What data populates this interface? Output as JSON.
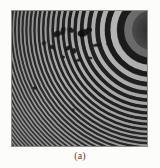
{
  "figure": {
    "caption": "(a)",
    "kind": "interference-fringe-photograph",
    "background_color": "#fcfcfa",
    "plate": {
      "left": 11,
      "top": 10,
      "width": 137,
      "height": 137,
      "border_color": "#8f8f8f"
    },
    "pattern": {
      "type": "concentric-circular-fringes",
      "center_x": 152,
      "center_y": 30,
      "fringe_count": 34,
      "min_gray": "#1d1d1d",
      "max_gray": "#c8c8c8",
      "mean_gray": "#6e6e6e",
      "spacing_px_near_center": 11,
      "spacing_px_far_edge": 3,
      "core_dark_radius": 20
    },
    "defects": [
      {
        "name": "dust-blob-1",
        "cx": 46,
        "cy": 24,
        "rx": 4.0,
        "ry": 3.0,
        "rot": -25,
        "gray": "#141414"
      },
      {
        "name": "dust-blob-2",
        "cx": 52,
        "cy": 21,
        "rx": 2.4,
        "ry": 4.2,
        "rot": 15,
        "gray": "#171717"
      },
      {
        "name": "dust-blob-3",
        "cx": 60,
        "cy": 20,
        "rx": 3.2,
        "ry": 2.2,
        "rot": 40,
        "gray": "#121212"
      },
      {
        "name": "dust-blob-4",
        "cx": 72,
        "cy": 23,
        "rx": 5.5,
        "ry": 3.8,
        "rot": -15,
        "gray": "#101010"
      },
      {
        "name": "dust-blob-5",
        "cx": 78,
        "cy": 20,
        "rx": 3.0,
        "ry": 2.4,
        "rot": 0,
        "gray": "#161616"
      },
      {
        "name": "dust-blob-6",
        "cx": 41,
        "cy": 37,
        "rx": 2.8,
        "ry": 2.0,
        "rot": 20,
        "gray": "#1a1a1a"
      },
      {
        "name": "dust-blob-7",
        "cx": 57,
        "cy": 38,
        "rx": 3.6,
        "ry": 2.0,
        "rot": -30,
        "gray": "#151515"
      },
      {
        "name": "dust-blob-8",
        "cx": 63,
        "cy": 41,
        "rx": 2.2,
        "ry": 3.0,
        "rot": 10,
        "gray": "#181818"
      },
      {
        "name": "dust-blob-9",
        "cx": 86,
        "cy": 35,
        "rx": 4.5,
        "ry": 1.6,
        "rot": -8,
        "gray": "#131313"
      },
      {
        "name": "dust-blob-10",
        "cx": 98,
        "cy": 34,
        "rx": 3.0,
        "ry": 1.4,
        "rot": -5,
        "gray": "#1b1b1b"
      },
      {
        "name": "dust-blob-11",
        "cx": 52,
        "cy": 47,
        "rx": 2.0,
        "ry": 1.6,
        "rot": 0,
        "gray": "#1e1e1e"
      },
      {
        "name": "dust-blob-12",
        "cx": 68,
        "cy": 50,
        "rx": 3.4,
        "ry": 1.5,
        "rot": -12,
        "gray": "#1a1a1a"
      },
      {
        "name": "dust-blob-13",
        "cx": 79,
        "cy": 48,
        "rx": 2.6,
        "ry": 1.3,
        "rot": 8,
        "gray": "#1d1d1d"
      },
      {
        "name": "dust-blob-14",
        "cx": 24,
        "cy": 78,
        "rx": 2.2,
        "ry": 1.8,
        "rot": 0,
        "gray": "#202020"
      },
      {
        "name": "dust-blob-15",
        "cx": 62,
        "cy": 100,
        "rx": 1.6,
        "ry": 1.4,
        "rot": 0,
        "gray": "#242424"
      },
      {
        "name": "dust-blob-16",
        "cx": 33,
        "cy": 33,
        "rx": 2.0,
        "ry": 2.6,
        "rot": 25,
        "gray": "#1c1c1c"
      }
    ]
  }
}
